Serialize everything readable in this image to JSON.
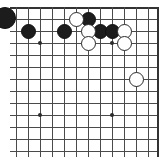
{
  "figure": {
    "kind": "go-board-diagram",
    "width": 164,
    "height": 157,
    "background_color": "#ffffff"
  },
  "board": {
    "line_color": "#4a4a4a",
    "edge_color": "#333333",
    "black_stone_color": "#1c1c1c",
    "white_stone_color": "#fefefe",
    "white_stone_outline": "#2a2a2a",
    "stone_diameter": 15,
    "cell_size": 12,
    "origin_x": 16,
    "origin_y": 7,
    "columns": 12,
    "rows": 13,
    "right_edge_x": 157,
    "top_edge_y": 7,
    "visible_edges": [
      "top",
      "right"
    ],
    "clipped_edges": [
      "bottom",
      "left"
    ],
    "vertical_line_x": [
      16,
      28,
      40,
      52,
      64,
      76,
      88,
      100,
      112,
      124,
      136,
      148,
      157
    ],
    "horizontal_line_y": [
      7,
      19,
      31,
      43,
      55,
      67,
      79,
      91,
      103,
      115,
      127,
      139,
      151
    ],
    "star_points": [
      {
        "x": 40,
        "y": 43
      },
      {
        "x": 112,
        "y": 43
      },
      {
        "x": 40,
        "y": 115
      },
      {
        "x": 112,
        "y": 115
      }
    ],
    "stones": [
      {
        "color": "black",
        "x": 28,
        "y": 31,
        "clipped": false
      },
      {
        "color": "black",
        "x": 64,
        "y": 31,
        "clipped": false
      },
      {
        "color": "black",
        "x": 88,
        "y": 19,
        "clipped": false
      },
      {
        "color": "black",
        "x": 100,
        "y": 31,
        "clipped": false
      },
      {
        "color": "black",
        "x": 112,
        "y": 31,
        "clipped": false
      },
      {
        "color": "white",
        "x": 76,
        "y": 19,
        "clipped": false
      },
      {
        "color": "white",
        "x": 88,
        "y": 31,
        "clipped": false
      },
      {
        "color": "white",
        "x": 88,
        "y": 43,
        "clipped": false
      },
      {
        "color": "white",
        "x": 124,
        "y": 31,
        "clipped": false
      },
      {
        "color": "white",
        "x": 124,
        "y": 43,
        "clipped": false
      },
      {
        "color": "white",
        "x": 136,
        "y": 79,
        "clipped": false
      }
    ],
    "off_board_marker": {
      "color": "black",
      "x": -6,
      "y": 18,
      "clipped": true,
      "note": "partial stone clipped by left edge of figure"
    }
  }
}
